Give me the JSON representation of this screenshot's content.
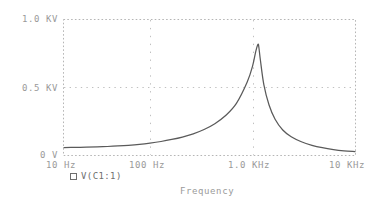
{
  "plot": {
    "axis_title": "Frequency",
    "y_ticks": [
      {
        "label": "1.0 KV",
        "value": 1000
      },
      {
        "label": "0.5 KV",
        "value": 500
      },
      {
        "label": "0 V",
        "value": 0
      }
    ],
    "x_ticks": [
      {
        "label": "10 Hz",
        "value": 10
      },
      {
        "label": "100 Hz",
        "value": 100
      },
      {
        "label": "1.0 KHz",
        "value": 1000
      },
      {
        "label": "10 KHz",
        "value": 10000
      }
    ],
    "legend": [
      {
        "marker": "square-marker-icon",
        "label": "V(C1:1)"
      }
    ],
    "colors": {
      "trace": "#5a5a5a",
      "grid": "#bdbdbd",
      "border": "#b0b0b0",
      "text": "#9a9a9a",
      "legend_text": "#6f6f6f",
      "background": "#ffffff"
    }
  },
  "chart_data": {
    "type": "line",
    "title": "",
    "subtitle": "",
    "xlabel": "Frequency",
    "ylabel": "",
    "xscale": "log",
    "xlim": [
      10,
      10000
    ],
    "ylim": [
      0,
      1000
    ],
    "y_unit": "V",
    "grid": true,
    "legend_position": "below-axis-left",
    "x_tick_labels": [
      "10 Hz",
      "100 Hz",
      "1.0 KHz",
      "10 KHz"
    ],
    "x_tick_values": [
      10,
      100,
      1000,
      10000
    ],
    "y_tick_labels": [
      "0 V",
      "0.5 KV",
      "1.0 KV"
    ],
    "y_tick_values": [
      0,
      500,
      1000
    ],
    "annotations": [
      "Series resonance peak near 1.0 KHz reaching about 0.82 KV"
    ],
    "series": [
      {
        "name": "V(C1:1)",
        "x": [
          10,
          13,
          17,
          22,
          28,
          36,
          46,
          60,
          77,
          100,
          129,
          166,
          215,
          278,
          359,
          464,
          599,
          774,
          880,
          950,
          1000,
          1020,
          1060,
          1150,
          1300,
          1500,
          1800,
          2200,
          2800,
          3600,
          4600,
          6000,
          7700,
          10000
        ],
        "values": [
          55,
          56,
          58,
          60,
          63,
          67,
          72,
          79,
          88,
          100,
          115,
          133,
          157,
          189,
          232,
          292,
          382,
          540,
          660,
          770,
          820,
          800,
          700,
          520,
          370,
          265,
          185,
          135,
          98,
          72,
          54,
          40,
          31,
          25
        ]
      }
    ]
  }
}
